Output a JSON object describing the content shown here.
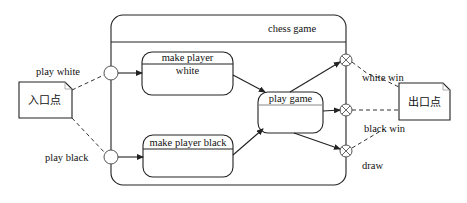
{
  "diagram": {
    "type": "UML state machine with entry/exit points",
    "composite_state": {
      "title": "chess game"
    },
    "states": [
      {
        "id": "make-player-white",
        "title": "make player",
        "body": "white"
      },
      {
        "id": "make-player-black",
        "title": "make player black",
        "body": ""
      },
      {
        "id": "play-game",
        "title": "play game",
        "body": ""
      }
    ],
    "entry_note": {
      "label": "入口点"
    },
    "exit_note": {
      "label": "出口点"
    },
    "entry_transitions": [
      {
        "label": "play white"
      },
      {
        "label": "play black"
      }
    ],
    "exit_transitions": [
      {
        "label": "white win"
      },
      {
        "label": "black win"
      },
      {
        "label": "draw"
      }
    ],
    "colors": {
      "line": "#222222",
      "background": "#ffffff"
    }
  }
}
